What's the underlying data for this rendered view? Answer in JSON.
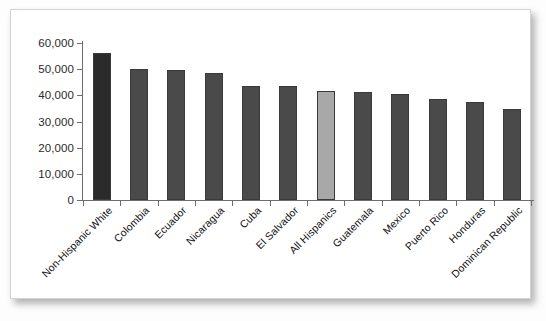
{
  "chart_data": {
    "type": "bar",
    "title": "",
    "subtitle": "",
    "xlabel": "",
    "ylabel": "",
    "ylim": [
      0,
      60000
    ],
    "ytick_labels": [
      "60,000",
      "50,000",
      "40,000",
      "30,000",
      "20,000",
      "10,000",
      "0"
    ],
    "ytick_values": [
      60000,
      50000,
      40000,
      30000,
      20000,
      10000,
      0
    ],
    "grid": false,
    "legend": "none",
    "categories": [
      "Non-Hispanic White",
      "Colombia",
      "Ecuador",
      "Nicaragua",
      "Cuba",
      "El Salvador",
      "All Hispanics",
      "Guatemala",
      "Mexico",
      "Puerto Rico",
      "Honduras",
      "Dominican Republic"
    ],
    "values": [
      56000,
      50000,
      49700,
      48700,
      43500,
      43400,
      41500,
      41100,
      40500,
      38500,
      37300,
      34800
    ],
    "bar_colors": [
      "#2b2b2b",
      "#4a4a4a",
      "#4a4a4a",
      "#4a4a4a",
      "#4a4a4a",
      "#4a4a4a",
      "#a8a8a8",
      "#4a4a4a",
      "#4a4a4a",
      "#4a4a4a",
      "#4a4a4a",
      "#4a4a4a"
    ],
    "highlight_category": "All Hispanics",
    "highlight_color": "#a8a8a8",
    "primary_color": "#4a4a4a",
    "emphasis_color": "#2b2b2b"
  }
}
